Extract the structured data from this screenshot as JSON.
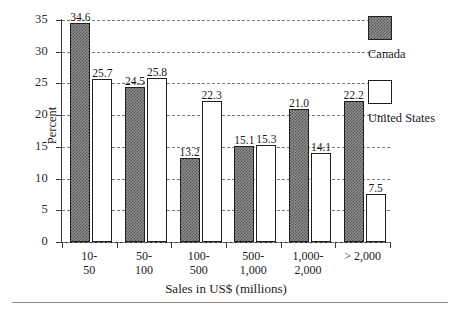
{
  "chart_data": {
    "type": "bar",
    "title": "",
    "xlabel": "Sales in US$ (millions)",
    "ylabel": "Percent",
    "ylim": [
      0,
      35
    ],
    "ytick_step": 5,
    "yticks": [
      "0",
      "5",
      "10",
      "15",
      "20",
      "25",
      "30",
      "35"
    ],
    "grid": true,
    "grid_style": "dashed horizontal",
    "legend_position": "right",
    "categories": [
      "10-\n50",
      "50-\n100",
      "100-\n500",
      "500-\n1,000",
      "1,000-\n2,000",
      "> 2,000"
    ],
    "category_lines": [
      [
        "10-",
        "50"
      ],
      [
        "50-",
        "100"
      ],
      [
        "100-",
        "500"
      ],
      [
        "500-",
        "1,000"
      ],
      [
        "1,000-",
        "2,000"
      ],
      [
        "> 2,000",
        ""
      ]
    ],
    "series": [
      {
        "name": "Canada",
        "color": "#8e8e8e",
        "pattern": "checkered",
        "values": [
          34.6,
          24.5,
          13.2,
          15.1,
          21.0,
          22.2
        ],
        "labels": [
          "34.6",
          "24.5",
          "13.2",
          "15.1",
          "21.0",
          "22.2"
        ]
      },
      {
        "name": "United States",
        "color": "#ffffff",
        "pattern": "solid",
        "values": [
          25.7,
          25.8,
          22.3,
          15.3,
          14.1,
          7.5
        ],
        "labels": [
          "25.7",
          "25.8",
          "22.3",
          "15.3",
          "14.1",
          "7.5"
        ]
      }
    ]
  },
  "legend": {
    "entries": [
      {
        "label": "Canada"
      },
      {
        "label": "United States"
      }
    ]
  },
  "axes": {
    "y_title": "Percent",
    "x_title": "Sales in US$ (millions)"
  }
}
